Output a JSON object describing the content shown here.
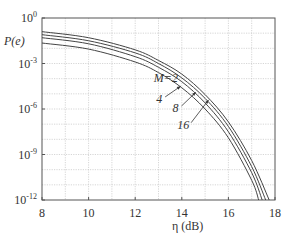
{
  "chart_data": {
    "type": "line",
    "title": "",
    "xlabel": "η (dB)",
    "ylabel": "P(e)",
    "xlim": [
      8,
      18
    ],
    "ylim_log10": [
      -12,
      0
    ],
    "yscale": "log",
    "grid": true,
    "x_ticks": [
      "8",
      "10",
      "12",
      "14",
      "16",
      "18"
    ],
    "x_tick_values": [
      8,
      10,
      12,
      14,
      16,
      18
    ],
    "y_ticks": [
      {
        "base": "10",
        "exp": "0",
        "value": 0
      },
      {
        "base": "10",
        "exp": "-3",
        "value": -3
      },
      {
        "base": "10",
        "exp": "-6",
        "value": -6
      },
      {
        "base": "10",
        "exp": "-9",
        "value": -9
      },
      {
        "base": "10",
        "exp": "-12",
        "value": -12
      }
    ],
    "series": [
      {
        "name": "M=2",
        "x": [
          8,
          10,
          12,
          13,
          14,
          15,
          16,
          17,
          17.3
        ],
        "log10_y": [
          -1.65,
          -2.05,
          -2.9,
          -3.6,
          -4.6,
          -6.0,
          -7.9,
          -10.7,
          -12
        ]
      },
      {
        "name": "4",
        "x": [
          8,
          10,
          12,
          13,
          14,
          15,
          16,
          17,
          17.45
        ],
        "log10_y": [
          -1.3,
          -1.7,
          -2.55,
          -3.25,
          -4.2,
          -5.6,
          -7.5,
          -10.2,
          -12
        ]
      },
      {
        "name": "8",
        "x": [
          8,
          10,
          12,
          13,
          14,
          15,
          16,
          17,
          17.6
        ],
        "log10_y": [
          -1.1,
          -1.5,
          -2.3,
          -3.0,
          -3.95,
          -5.3,
          -7.15,
          -9.8,
          -12
        ]
      },
      {
        "name": "16",
        "x": [
          8,
          10,
          12,
          13,
          14,
          15,
          16,
          17,
          17.75
        ],
        "log10_y": [
          -0.9,
          -1.3,
          -2.1,
          -2.8,
          -3.7,
          -5.05,
          -6.85,
          -9.4,
          -12
        ]
      }
    ],
    "annotations": [
      {
        "text": "M=2",
        "x": 12.8,
        "log10_y": -4.2
      },
      {
        "text": "4",
        "x": 12.9,
        "log10_y": -5.6,
        "arrow_to": {
          "x": 13.95,
          "log10_y": -4.5
        }
      },
      {
        "text": "8",
        "x": 13.6,
        "log10_y": -6.2,
        "arrow_to": {
          "x": 14.6,
          "log10_y": -4.9
        }
      },
      {
        "text": "16",
        "x": 13.8,
        "log10_y": -7.3,
        "arrow_to": {
          "x": 15.15,
          "log10_y": -5.4
        }
      }
    ]
  }
}
